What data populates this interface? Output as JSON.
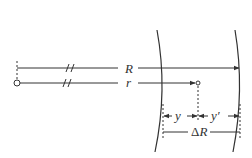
{
  "diagram": {
    "labels": {
      "R": "R",
      "r": "r",
      "y": "y",
      "y_prime": "y′",
      "delta_prefix": "Δ",
      "delta_var": "R"
    },
    "colors": {
      "stroke": "#333333",
      "background": "#ffffff"
    }
  }
}
